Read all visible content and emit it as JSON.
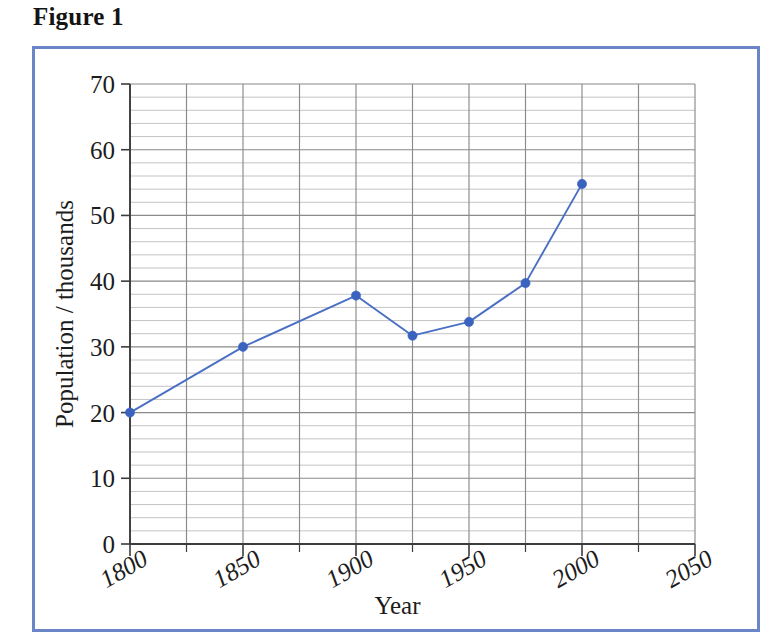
{
  "figure": {
    "caption": "Figure 1",
    "frame_color": "#6a85c8"
  },
  "chart_data": {
    "type": "line",
    "title": "",
    "xlabel": "Year",
    "ylabel": "Population / thousands",
    "xlim": [
      1800,
      2050
    ],
    "ylim": [
      0,
      70
    ],
    "xticks": [
      1800,
      1850,
      1900,
      1950,
      2000,
      2050
    ],
    "xtick_labels": [
      "1800",
      "1850",
      "1900",
      "1950",
      "2000",
      "2050"
    ],
    "xtick_minor_step": 25,
    "yticks": [
      0,
      10,
      20,
      30,
      40,
      50,
      60,
      70
    ],
    "ytick_labels": [
      "0",
      "10",
      "20",
      "30",
      "40",
      "50",
      "60",
      "70"
    ],
    "ytick_minor_step": 2,
    "grid": true,
    "grid_major_color": "#8a8a8a",
    "grid_minor_color": "#b8b8b8",
    "legend": false,
    "series_color": "#4a6fc4",
    "marker": "circle",
    "x": [
      1800,
      1850,
      1900,
      1925,
      1950,
      1975,
      2000
    ],
    "values": [
      20.0,
      30.0,
      37.8,
      31.7,
      33.8,
      39.7,
      54.8
    ],
    "points": [
      {
        "x": 1800,
        "y": 20.0
      },
      {
        "x": 1850,
        "y": 30.0
      },
      {
        "x": 1900,
        "y": 37.8
      },
      {
        "x": 1925,
        "y": 31.7
      },
      {
        "x": 1950,
        "y": 33.8
      },
      {
        "x": 1975,
        "y": 39.7
      },
      {
        "x": 2000,
        "y": 54.8
      }
    ]
  }
}
